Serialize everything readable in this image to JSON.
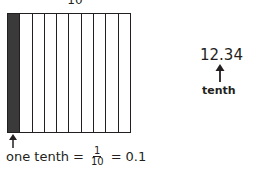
{
  "model": {
    "top_label": "10",
    "total_strips": 10,
    "shaded_strips": 1,
    "shade_color": "#3a3a3a"
  },
  "caption": {
    "words": "one tenth",
    "equals1": "=",
    "fraction_numerator": "1",
    "fraction_denominator": "10",
    "equals2": "=",
    "decimal": "0.1"
  },
  "place_value": {
    "number": "12.34",
    "label": "tenth"
  }
}
